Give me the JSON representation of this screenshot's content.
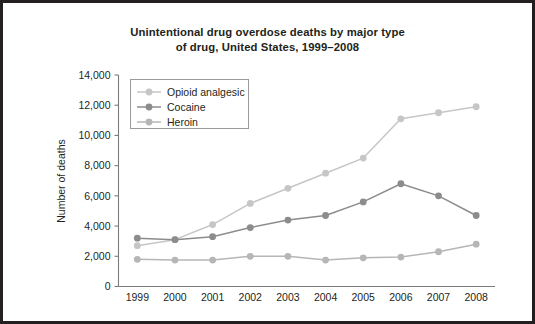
{
  "chart_data": {
    "type": "line",
    "title": "Unintentional drug overdose deaths by major type of drug, United States, 1999–2008",
    "title_line1": "Unintentional drug overdose deaths by major type",
    "title_line2": "of drug, United States, 1999–2008",
    "xlabel": "",
    "ylabel": "Number of deaths",
    "categories": [
      "1999",
      "2000",
      "2001",
      "2002",
      "2003",
      "2004",
      "2005",
      "2006",
      "2007",
      "2008"
    ],
    "x": [
      1999,
      2000,
      2001,
      2002,
      2003,
      2004,
      2005,
      2006,
      2007,
      2008
    ],
    "ylim": [
      0,
      14000
    ],
    "yticks": [
      0,
      2000,
      4000,
      6000,
      8000,
      10000,
      12000,
      14000
    ],
    "ytick_labels": [
      "0",
      "2,000",
      "4,000",
      "6,000",
      "8,000",
      "10,000",
      "12,000",
      "14,000"
    ],
    "grid": false,
    "legend_position": "upper-left-inside",
    "series": [
      {
        "name": "Opioid analgesic",
        "color": "#c6c6c6",
        "values": [
          2700,
          3100,
          4100,
          5500,
          6500,
          7500,
          8500,
          11100,
          11500,
          11900
        ]
      },
      {
        "name": "Cocaine",
        "color": "#8c8c8c",
        "values": [
          3200,
          3100,
          3300,
          3900,
          4400,
          4700,
          5600,
          6800,
          6000,
          4700
        ]
      },
      {
        "name": "Heroin",
        "color": "#b6b6b6",
        "values": [
          1800,
          1750,
          1750,
          2000,
          2000,
          1750,
          1900,
          1950,
          2300,
          2800
        ]
      }
    ]
  },
  "legend": {
    "items": [
      {
        "label": "Opioid analgesic"
      },
      {
        "label": "Cocaine"
      },
      {
        "label": "Heroin"
      }
    ]
  },
  "colors": {
    "border": "#231f20",
    "axis": "#7b7b7b",
    "text": "#231f20",
    "background": "#ffffff",
    "opioid": "#c6c6c6",
    "cocaine": "#8c8c8c",
    "heroin": "#b6b6b6"
  }
}
